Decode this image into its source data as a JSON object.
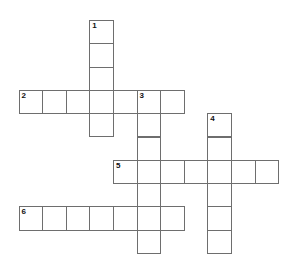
{
  "puzzle": {
    "type": "crossword",
    "grid_size": {
      "cols": 11,
      "rows": 10
    },
    "colors": {
      "line": "#6e6e6e",
      "cell_fill": "#ffffff",
      "number": "#111111"
    },
    "entries": [
      {
        "number": "1",
        "direction": "down",
        "row": 0,
        "col": 3,
        "length": 5
      },
      {
        "number": "2",
        "direction": "across",
        "row": 3,
        "col": 0,
        "length": 7
      },
      {
        "number": "3",
        "direction": "down",
        "row": 3,
        "col": 5,
        "length": 7
      },
      {
        "number": "4",
        "direction": "down",
        "row": 4,
        "col": 8,
        "length": 6
      },
      {
        "number": "5",
        "direction": "across",
        "row": 6,
        "col": 4,
        "length": 7
      },
      {
        "number": "6",
        "direction": "across",
        "row": 8,
        "col": 0,
        "length": 7
      }
    ]
  }
}
